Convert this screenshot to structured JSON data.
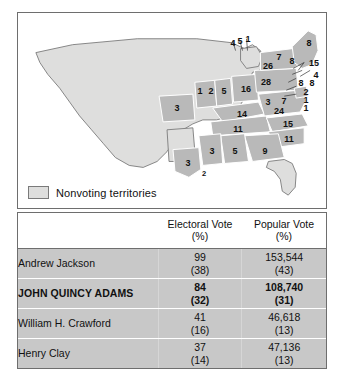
{
  "map": {
    "title": "Election of 1824 electoral map",
    "legend": {
      "swatch_name": "nonvoting-territories-swatch",
      "label": "Nonvoting territories"
    },
    "colors": {
      "voting_state": "#b9b9b9",
      "nonvoting_territory": "#dededd",
      "border": "#6e6e6e",
      "background": "#ffffff"
    },
    "state_labels": [
      {
        "id": "maine",
        "value": "8",
        "x": 300,
        "y": 30
      },
      {
        "id": "vermont",
        "value": "7",
        "x": 269,
        "y": 44
      },
      {
        "id": "new-hampshire",
        "value": "8",
        "x": 282,
        "y": 48
      },
      {
        "id": "massachusetts",
        "value": "15",
        "x": 304,
        "y": 51
      },
      {
        "id": "new-york",
        "value": "26",
        "x": 258,
        "y": 53
      },
      {
        "id": "michigan-terr-4",
        "value": "4",
        "x": 232,
        "y": 42
      },
      {
        "id": "michigan-terr-5",
        "value": "5",
        "x": 239,
        "y": 41
      },
      {
        "id": "michigan-terr-1",
        "value": "1",
        "x": 246,
        "y": 40
      },
      {
        "id": "rhode-island",
        "value": "4",
        "x": 304,
        "y": 62
      },
      {
        "id": "connecticut",
        "value": "8",
        "x": 288,
        "y": 68
      },
      {
        "id": "new-jersey",
        "value": "8",
        "x": 298,
        "y": 68
      },
      {
        "id": "pennsylvania",
        "value": "28",
        "x": 255,
        "y": 69
      },
      {
        "id": "delaware",
        "value": "2",
        "x": 292,
        "y": 77
      },
      {
        "id": "maryland-1",
        "value": "1",
        "x": 292,
        "y": 84
      },
      {
        "id": "maryland-2",
        "value": "1",
        "x": 292,
        "y": 92
      },
      {
        "id": "ohio",
        "value": "16",
        "x": 228,
        "y": 79
      },
      {
        "id": "indiana",
        "value": "5",
        "x": 205,
        "y": 80
      },
      {
        "id": "illinois-1",
        "value": "1",
        "x": 180,
        "y": 80
      },
      {
        "id": "illinois-2",
        "value": "2",
        "x": 191,
        "y": 80
      },
      {
        "id": "missouri",
        "value": "3",
        "x": 158,
        "y": 96
      },
      {
        "id": "virginia-3",
        "value": "3",
        "x": 254,
        "y": 88
      },
      {
        "id": "virginia-7",
        "value": "7",
        "x": 268,
        "y": 87
      },
      {
        "id": "virginia-24",
        "value": "24",
        "x": 263,
        "y": 97
      },
      {
        "id": "kentucky",
        "value": "14",
        "x": 228,
        "y": 98
      },
      {
        "id": "tennessee",
        "value": "11",
        "x": 225,
        "y": 115
      },
      {
        "id": "north-carolina",
        "value": "15",
        "x": 273,
        "y": 110
      },
      {
        "id": "south-carolina",
        "value": "11",
        "x": 270,
        "y": 125
      },
      {
        "id": "georgia",
        "value": "9",
        "x": 248,
        "y": 139
      },
      {
        "id": "alabama",
        "value": "5",
        "x": 219,
        "y": 140
      },
      {
        "id": "mississippi",
        "value": "3",
        "x": 197,
        "y": 140
      },
      {
        "id": "louisiana",
        "value": "3",
        "x": 177,
        "y": 157
      },
      {
        "id": "mississippi-gulf",
        "value": "2",
        "x": 192,
        "y": 164
      }
    ]
  },
  "table": {
    "headers": {
      "name": "",
      "electoral_main": "Electoral Vote",
      "electoral_pct": "(%)",
      "popular_main": "Popular Vote",
      "popular_pct": "(%)"
    },
    "rows": [
      {
        "candidate": "Andrew Jackson",
        "winner": false,
        "electoral_vote": "99",
        "electoral_pct": "(38)",
        "popular_vote": "153,544",
        "popular_pct": "(43)"
      },
      {
        "candidate": "JOHN QUINCY ADAMS",
        "winner": true,
        "electoral_vote": "84",
        "electoral_pct": "(32)",
        "popular_vote": "108,740",
        "popular_pct": "(31)"
      },
      {
        "candidate": "William H. Crawford",
        "winner": false,
        "electoral_vote": "41",
        "electoral_pct": "(16)",
        "popular_vote": "46,618",
        "popular_pct": "(13)"
      },
      {
        "candidate": "Henry Clay",
        "winner": false,
        "electoral_vote": "37",
        "electoral_pct": "(14)",
        "popular_vote": "47,136",
        "popular_pct": "(13)"
      }
    ]
  }
}
